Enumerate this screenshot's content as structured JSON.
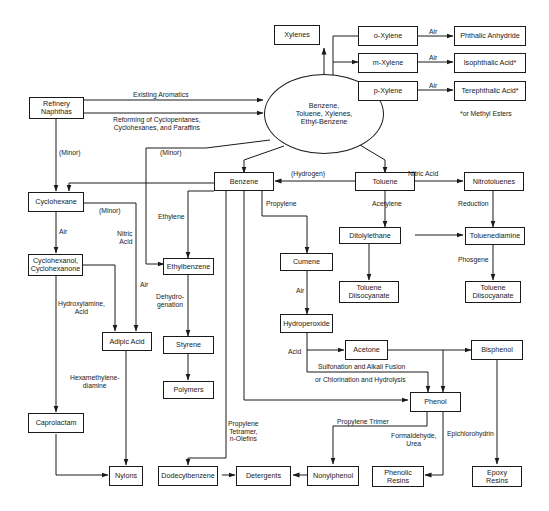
{
  "diagram": {
    "source": {
      "refinery": "Refinery\nNaphthas"
    },
    "hub": {
      "aromatics": "Benzene,\nToluene, Xylenes,\nEthyl-Benzene"
    },
    "nodes": {
      "xylenes": "Xylenes",
      "o_xylene": "o-Xylene",
      "m_xylene": "m-Xylene",
      "p_xylene": "p-Xylene",
      "phthalic_anhydride": "Phthalic Anhydride",
      "isophthalic_acid": "Isophthalic Acid*",
      "terephthalic_acid": "Terephthalic Acid*",
      "benzene": "Benzene",
      "toluene": "Toluene",
      "nitrotoluenes": "Nitrotoluenes",
      "cyclohexane": "Cyclohexane",
      "cyclohexanol": "Cyclohexanol,\nCyclohexanone",
      "adipic_acid": "Adipic Acid",
      "caprolactam": "Caprolactam",
      "nylons": "Nylons",
      "ethylbenzene": "Ethylbenzene",
      "styrene": "Styrene",
      "polymers": "Polymers",
      "cumene": "Cumene",
      "hydroperoxide": "Hydroperoxide",
      "acetone": "Acetone",
      "bisphenol": "Bisphenol",
      "phenol": "Phenol",
      "ditolylethane": "Ditolylethane",
      "toluenediamine": "Toluenediamine",
      "tdi_left": "Toluene\nDiisocyanate",
      "tdi_right": "Toluene\nDiisocyanate",
      "dodecylbenzene": "Dodecylbenzene",
      "detergents": "Detergents",
      "nonylphenol": "Nonylphenol",
      "phenolic_resins": "Phenolic\nResins",
      "epoxy_resins": "Epoxy\nResins"
    },
    "edge_labels": {
      "existing_aromatics": "Existing Aromatics",
      "reforming": "Reforming of Cyclopentanes,\nCyclohexanes, and Paraffins",
      "air_o": "Air",
      "air_m": "Air",
      "air_p": "Air",
      "footnote": "*or Methyl Esters",
      "minor_left": "(Minor)",
      "minor_mid": "(Minor)",
      "minor_cyclo": "(Minor)",
      "hydrogen": "(Hydrogen)",
      "nitric_acid_toluene": "Nitric Acid",
      "ethylene": "Ethylene",
      "propylene": "Propylene",
      "acetylene": "Acetylene",
      "reduction": "Reduction",
      "phosgene": "Phosgene",
      "air_cyclohexane": "Air",
      "nitric_acid_adipic": "Nitric\nAcid",
      "air_adipic": "Air",
      "hydroxylamine": "Hydroxylamine,\nAcid",
      "dehydrogenation": "Dehydro-\ngenation",
      "air_cumene": "Air",
      "acid": "Acid",
      "sulfonation": "Sulfonation and Alkali Fusion",
      "chlorination": "or Chlorination and Hydrolysis",
      "hexamethylenediamine": "Hexamethylene-\ndiamine",
      "propylene_tetramer": "Propylene\nTetramer,\nn-Olefins",
      "propylene_trimer": "Propylene Trimer",
      "formaldehyde": "Formaldehyde,\nUrea",
      "epichlorohydrin": "Epichlorohydrin"
    }
  }
}
